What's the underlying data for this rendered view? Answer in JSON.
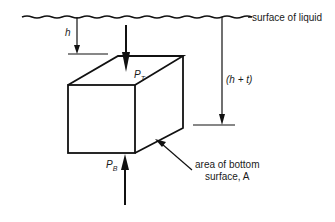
{
  "diagram": {
    "surface_label": "surface of liquid",
    "depth_top_label": "h",
    "depth_bottom_label": "(h + t)",
    "top_force_label": "P",
    "top_force_sub": "T",
    "bottom_force_label": "P",
    "bottom_force_sub": "B",
    "area_label_line1": "area of bottom",
    "area_label_line2": "surface, A",
    "stroke_color": "#111111"
  }
}
